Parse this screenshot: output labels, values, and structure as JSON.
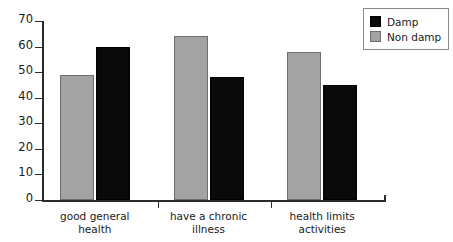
{
  "chart_data": {
    "type": "bar",
    "title": "",
    "subtitle": "",
    "xlabel": "",
    "ylabel": "",
    "ylim": [
      0,
      70
    ],
    "yticks": [
      0,
      10,
      20,
      30,
      40,
      50,
      60,
      70
    ],
    "ytick_labels": [
      "0",
      "10",
      "20",
      "30",
      "40",
      "50",
      "60",
      "70"
    ],
    "grid": false,
    "legend_position": "top-right",
    "categories": [
      "good general health",
      "have a chronic illness",
      "health limits activities"
    ],
    "category_lines": [
      [
        "good general",
        "health"
      ],
      [
        "have a chronic",
        "illness"
      ],
      [
        "health limits",
        "activities"
      ]
    ],
    "series": [
      {
        "name": "Damp",
        "color": "#0a0a0a",
        "values": [
          60,
          48,
          45
        ]
      },
      {
        "name": "Non damp",
        "color": "#a3a3a3",
        "values": [
          49,
          64,
          58
        ]
      }
    ],
    "series_draw_order": [
      "Non damp",
      "Damp"
    ]
  },
  "legend": {
    "items": [
      {
        "label": "Damp",
        "swatch_class": "series-damp"
      },
      {
        "label": "Non damp",
        "swatch_class": "series-nondamp"
      }
    ]
  }
}
